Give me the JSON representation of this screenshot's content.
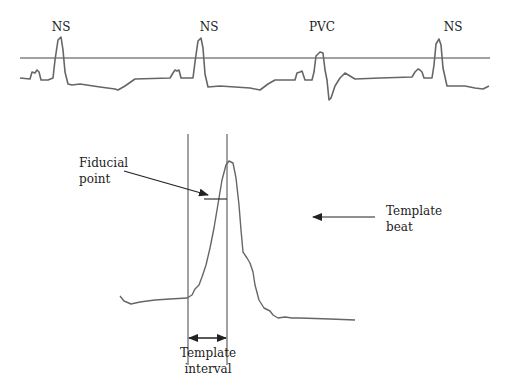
{
  "diagram": {
    "title": "",
    "colors": {
      "trace": "#666666",
      "line": "#333333",
      "text": "#222222"
    },
    "top_strip": {
      "beat_labels": [
        {
          "label": "NS",
          "x": 60
        },
        {
          "label": "NS",
          "x": 208
        },
        {
          "label": "PVC",
          "x": 322
        },
        {
          "label": "NS",
          "x": 452
        }
      ],
      "threshold_line": "horizontal reference line"
    },
    "template_view": {
      "fiducial_label": [
        "Fiducial",
        "point"
      ],
      "template_beat_label": [
        "Template",
        "beat"
      ],
      "template_interval_label": [
        "Template",
        "interval"
      ]
    }
  }
}
